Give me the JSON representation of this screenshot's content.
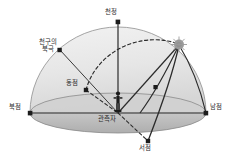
{
  "figure": {
    "background_color": "#ffffff",
    "stroke_color": "#2b2b2b",
    "dome_fill": "#e3e3e3",
    "ground_fill": "#b8b8b8",
    "sun_color": "#9a9a9a"
  },
  "labels": {
    "zenith": "천정",
    "north_celestial_pole_line1": "천구의",
    "north_celestial_pole_line2": "북극",
    "east_point": "동점",
    "north_point": "북점",
    "south_point": "남점",
    "west_point": "서점",
    "observer": "관측자"
  },
  "markers": {
    "zenith_marker": "square-marker",
    "pole_marker": "square-marker",
    "east_marker": "square-marker",
    "north_marker": "square-marker",
    "south_marker": "square-marker",
    "west_marker": "square-marker",
    "sun_marker": "sun-star-icon",
    "path_marker": "square-marker",
    "observer_figure": "person-icon"
  },
  "paths": {
    "ecliptic": "dashed-arc",
    "diurnal": "solid-arc",
    "horizon": "ellipse",
    "vertical_axis": "zenith-to-observer-line"
  }
}
